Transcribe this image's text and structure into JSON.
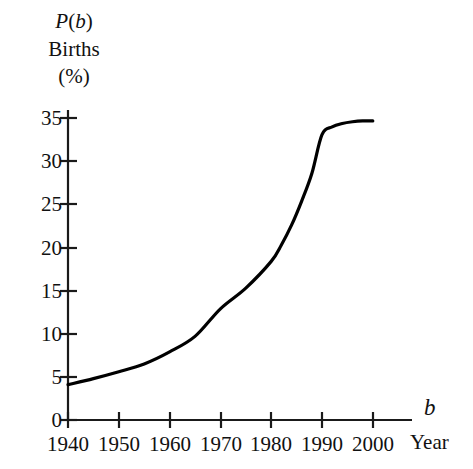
{
  "chart_data": {
    "type": "line",
    "title": "",
    "subtitle": "",
    "xlabel_symbol": "b",
    "xlabel_name": "Year",
    "ylabel_lines": [
      "P(b)",
      "Births",
      "(%)"
    ],
    "ylabel_symbol": "P(b)",
    "ylabel_name": "Births",
    "ylabel_unit": "(%)",
    "xlim": [
      1940,
      2003
    ],
    "ylim": [
      0,
      36
    ],
    "xticks": [
      1940,
      1950,
      1960,
      1970,
      1980,
      1990,
      2000
    ],
    "xtick_labels": [
      "1940",
      "1950",
      "1960",
      "1970",
      "1980",
      "1990",
      "2000"
    ],
    "yticks": [
      0,
      5,
      10,
      15,
      20,
      25,
      30,
      35
    ],
    "ytick_labels": [
      "0",
      "5",
      "10",
      "15",
      "20",
      "25",
      "30",
      "35"
    ],
    "grid": false,
    "legend": "none",
    "series": [
      {
        "name": "Births to unmarried women",
        "color": "#000000",
        "line_width": 3.2,
        "x": [
          1940,
          1945,
          1950,
          1955,
          1960,
          1965,
          1970,
          1975,
          1980,
          1982,
          1984,
          1986,
          1988,
          1990,
          1992,
          1994,
          1996,
          1998,
          2000
        ],
        "y": [
          4.1,
          4.8,
          5.6,
          6.5,
          7.9,
          9.7,
          12.9,
          15.3,
          18.4,
          20.3,
          22.6,
          25.4,
          28.6,
          33.1,
          34.0,
          34.4,
          34.6,
          34.7,
          34.7
        ]
      }
    ],
    "annotations": []
  },
  "geometry": {
    "x_axis_y": 420,
    "y_axis_x": 68,
    "x_axis_end": 412,
    "y_axis_top": 110,
    "px_per_year": 5.08,
    "px_per_percent": 8.62
  },
  "axis_end_labels": {
    "x_symbol": "b",
    "x_name": "Year"
  },
  "colors": {
    "background": "#ffffff",
    "axis": "#1a1a1a",
    "curve": "#000000",
    "text": "#111111"
  }
}
